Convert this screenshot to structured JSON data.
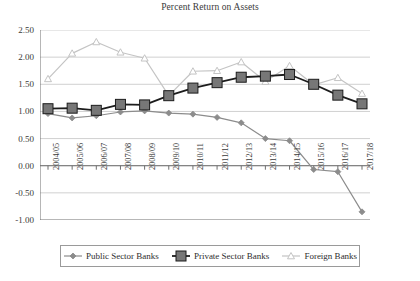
{
  "chart_data": {
    "type": "line",
    "title": "Percent Return on Assets",
    "xlabel": "",
    "ylabel": "",
    "ylim": [
      -1.0,
      2.5
    ],
    "ytick_step": 0.5,
    "yticks": [
      "2.50",
      "2.00",
      "1.50",
      "1.00",
      "0.50",
      "0.00",
      "-0.50",
      "-1.00"
    ],
    "ytick_values": [
      2.5,
      2.0,
      1.5,
      1.0,
      0.5,
      0.0,
      -0.5,
      -1.0
    ],
    "grid": "horizontal",
    "legend_position": "bottom",
    "categories": [
      "2004/05",
      "2005/06",
      "2006/07",
      "2007/08",
      "2008/09",
      "2009/10",
      "2010/11",
      "2011/12",
      "2012/13",
      "2013/14",
      "2014/15",
      "2015/16",
      "2016/17",
      "2017/18"
    ],
    "series": [
      {
        "name": "Public Sector Banks",
        "color": "#8c8c8c",
        "marker": "diamond",
        "marker_size": 3,
        "line_width": 1.2,
        "values": [
          0.96,
          0.88,
          0.92,
          0.99,
          1.01,
          0.97,
          0.95,
          0.89,
          0.79,
          0.5,
          0.46,
          -0.07,
          -0.11,
          -0.85
        ]
      },
      {
        "name": "Private Sector Banks",
        "color": "#1c1c1c",
        "marker_fill": "#777777",
        "marker": "square",
        "marker_size": 5,
        "line_width": 1.8,
        "values": [
          1.05,
          1.06,
          1.02,
          1.13,
          1.12,
          1.29,
          1.43,
          1.53,
          1.63,
          1.65,
          1.68,
          1.5,
          1.3,
          1.14
        ]
      },
      {
        "name": "Foreign Banks",
        "color": "#c4c4c4",
        "marker": "triangle",
        "marker_size": 3.5,
        "line_width": 1.2,
        "values": [
          1.6,
          2.07,
          2.28,
          2.09,
          1.98,
          1.29,
          1.74,
          1.75,
          1.91,
          1.55,
          1.84,
          1.49,
          1.62,
          1.33
        ]
      }
    ]
  },
  "axis": {
    "axis_color": "#6f6f6f",
    "grid_color": "#d0d0d0"
  },
  "legend": {
    "entries": [
      {
        "label": "Public Sector Banks"
      },
      {
        "label": "Private Sector Banks"
      },
      {
        "label": "Foreign Banks"
      }
    ]
  }
}
